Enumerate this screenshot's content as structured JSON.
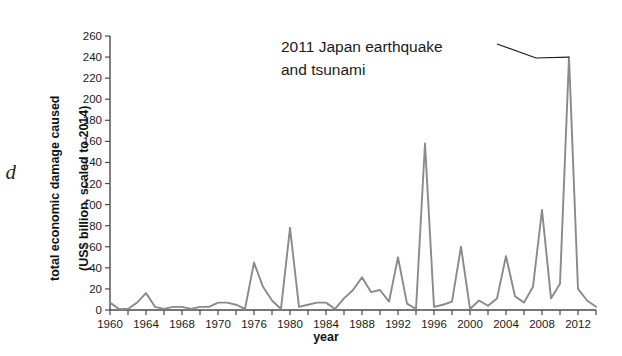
{
  "figure": {
    "edge_fragment": "d",
    "line_color": "#8a8a8a",
    "axis_color": "#4a4a4a",
    "background": "#ffffff"
  },
  "annotation": {
    "line1": "2011 Japan earthquake",
    "line2": "and tsunami"
  },
  "chart_data": {
    "type": "line",
    "title": "",
    "subtitle": "",
    "xlabel": "year",
    "ylabel": "total economic damage caused\n(US$ billion, scaled to 2014)",
    "ylabel_line1": "total economic damage caused",
    "ylabel_line2": "(US$ billion, scaled to 2014)",
    "xlim": [
      1960,
      2014
    ],
    "ylim": [
      0,
      260
    ],
    "grid": false,
    "legend": "none",
    "y_ticks": [
      0,
      20,
      40,
      60,
      80,
      100,
      120,
      140,
      160,
      180,
      200,
      220,
      240,
      260
    ],
    "y_tick_labels": [
      "0",
      "20",
      "40",
      "60",
      "80",
      "100",
      "120",
      "140",
      "160",
      "180",
      "200",
      "220",
      "240",
      "260"
    ],
    "x_ticks": [
      1960,
      1962,
      1964,
      1966,
      1968,
      1970,
      1972,
      1974,
      1976,
      1978,
      1980,
      1982,
      1984,
      1986,
      1988,
      1990,
      1992,
      1994,
      1996,
      1998,
      2000,
      2002,
      2004,
      2006,
      2008,
      2010,
      2012,
      2014
    ],
    "x_tick_labels": [
      {
        "year": 1960,
        "label": "1960"
      },
      {
        "year": 1964,
        "label": "1964"
      },
      {
        "year": 1968,
        "label": "1968"
      },
      {
        "year": 1972,
        "label": "1970"
      },
      {
        "year": 1976,
        "label": "1976"
      },
      {
        "year": 1980,
        "label": "1980"
      },
      {
        "year": 1984,
        "label": "1984"
      },
      {
        "year": 1988,
        "label": "1988"
      },
      {
        "year": 1992,
        "label": "1992"
      },
      {
        "year": 1996,
        "label": "1996"
      },
      {
        "year": 2000,
        "label": "2000"
      },
      {
        "year": 2004,
        "label": "2004"
      },
      {
        "year": 2008,
        "label": "2008"
      },
      {
        "year": 2012,
        "label": "2012"
      }
    ],
    "x": [
      1960,
      1961,
      1962,
      1963,
      1964,
      1965,
      1966,
      1967,
      1968,
      1969,
      1970,
      1971,
      1972,
      1973,
      1974,
      1975,
      1976,
      1977,
      1978,
      1979,
      1980,
      1981,
      1982,
      1983,
      1984,
      1985,
      1986,
      1987,
      1988,
      1989,
      1990,
      1991,
      1992,
      1993,
      1994,
      1995,
      1996,
      1997,
      1998,
      1999,
      2000,
      2001,
      2002,
      2003,
      2004,
      2005,
      2006,
      2007,
      2008,
      2009,
      2010,
      2011,
      2012,
      2013,
      2014
    ],
    "values": [
      7,
      1,
      1,
      7,
      16,
      3,
      1,
      3,
      3,
      1,
      3,
      3,
      7,
      7,
      5,
      1,
      45,
      22,
      9,
      1,
      78,
      3,
      5,
      7,
      7,
      1,
      11,
      19,
      31,
      17,
      19,
      8,
      50,
      6,
      1,
      158,
      3,
      5,
      8,
      60,
      1,
      9,
      4,
      11,
      51,
      13,
      7,
      22,
      95,
      11,
      25,
      240,
      20,
      9,
      3
    ],
    "series_name": "total economic damage",
    "annotations": [
      {
        "text": "2011 Japan earthquake and tsunami",
        "points_to_year": 2011,
        "points_to_value": 240
      }
    ]
  }
}
